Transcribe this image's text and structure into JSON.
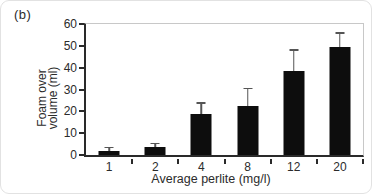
{
  "figure": {
    "panel_label": "(b)"
  },
  "chart_data": {
    "type": "bar",
    "title": "",
    "categories": [
      "1",
      "2",
      "4",
      "8",
      "12",
      "20"
    ],
    "values": [
      1.8,
      3.6,
      18.8,
      22.3,
      38.5,
      49.5
    ],
    "errors_up": [
      1.4,
      1.4,
      4.6,
      7.9,
      9.2,
      6.0
    ],
    "xlabel": "Average perlite (mg/l)",
    "ylabel": "Foam over volume (ml)",
    "ylabel_lines": [
      "Foam over",
      "volume (ml)"
    ],
    "ylim": [
      0,
      60
    ],
    "yticks": [
      0,
      10,
      20,
      30,
      40,
      50,
      60
    ],
    "grid": false,
    "legend": null,
    "bar_color": "#0d0d0d",
    "axis_color": "#2a2a2a",
    "frame_color": "#c8c8c8",
    "error_bar_color": "#555555"
  },
  "colors": {
    "background": "#ffffff",
    "text": "#2b2b2b"
  }
}
